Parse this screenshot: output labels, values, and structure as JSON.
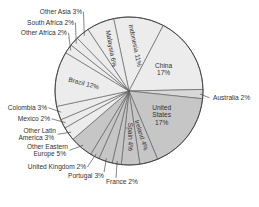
{
  "chart_data": {
    "type": "pie",
    "title": "",
    "start_angle_deg": -12,
    "direction": "clockwise",
    "center": [
      129,
      91
    ],
    "radius": 74,
    "colors": {
      "light": "#ececec",
      "medium": "#c6c6c6",
      "australia": "#d8d8d8",
      "edge": "#555555",
      "rim": "#444444"
    },
    "slices": [
      {
        "label": "Indonesia",
        "value": 11,
        "shade": "light",
        "text": "Indonesia 11%",
        "inside": true,
        "rotate": 78
      },
      {
        "label": "China",
        "value": 17,
        "shade": "light",
        "text": "China\n17%",
        "inside": true,
        "rotate": 0
      },
      {
        "label": "Australia",
        "value": 2,
        "shade": "australia",
        "text": "Australia 2%",
        "inside": false
      },
      {
        "label": "United States",
        "value": 17,
        "shade": "medium",
        "text": "United\nStates\n17%",
        "inside": true,
        "rotate": 0
      },
      {
        "label": "Ireland",
        "value": 4,
        "shade": "medium",
        "text": "Ireland 4%",
        "inside": true,
        "rotate": 72
      },
      {
        "label": "Spain",
        "value": 4,
        "shade": "medium",
        "text": "Spain 4%",
        "inside": true,
        "rotate": 90
      },
      {
        "label": "France",
        "value": 2,
        "shade": "medium",
        "text": "France 2%",
        "inside": false
      },
      {
        "label": "Portugal",
        "value": 3,
        "shade": "medium",
        "text": "Portugal 3%",
        "inside": false
      },
      {
        "label": "United Kingdom",
        "value": 2,
        "shade": "medium",
        "text": "United Kingdom 2%",
        "inside": false
      },
      {
        "label": "Other Eastern Europe",
        "value": 5,
        "shade": "medium",
        "text": "Other Eastern\nEurope 5%",
        "inside": false
      },
      {
        "label": "Other Latin America",
        "value": 3,
        "shade": "light",
        "text": "Other Latin\nAmerica 3%",
        "inside": false
      },
      {
        "label": "Mexico",
        "value": 2,
        "shade": "light",
        "text": "Mexico 2%",
        "inside": false
      },
      {
        "label": "Colombia",
        "value": 3,
        "shade": "light",
        "text": "Colombia 3%",
        "inside": false
      },
      {
        "label": "Brazil",
        "value": 12,
        "shade": "light",
        "text": "Brazil 12%",
        "inside": true,
        "rotate": 15
      },
      {
        "label": "Other Africa",
        "value": 2,
        "shade": "light",
        "text": "Other Africa 2%",
        "inside": false
      },
      {
        "label": "South Africa",
        "value": 2,
        "shade": "light",
        "text": "South Africa 2%",
        "inside": false
      },
      {
        "label": "Other Asia",
        "value": 3,
        "shade": "light",
        "text": "Other Asia 3%",
        "inside": false
      },
      {
        "label": "Malaysia",
        "value": 6,
        "shade": "light",
        "text": "Malaysia 6%",
        "inside": true,
        "rotate": 80
      }
    ],
    "external_labels": {
      "Australia": {
        "x": 211,
        "y": 100,
        "anchor": "start",
        "lines": [
          "Australia 2%"
        ]
      },
      "France": {
        "x": 104,
        "y": 184,
        "anchor": "start",
        "lines": [
          "France 2%"
        ]
      },
      "Portugal": {
        "x": 66,
        "y": 178,
        "anchor": "start",
        "lines": [
          "Portugal 3%"
        ]
      },
      "United Kingdom": {
        "x": 86,
        "y": 169,
        "anchor": "end",
        "lines": [
          "United Kingdom 2%"
        ]
      },
      "Other Eastern Europe": {
        "x": 68,
        "y": 149,
        "anchor": "end",
        "lines": [
          "Other Eastern",
          "Europe 5%"
        ]
      },
      "Other Latin America": {
        "x": 56,
        "y": 133,
        "anchor": "end",
        "lines": [
          "Other Latin",
          "America 3%"
        ]
      },
      "Mexico": {
        "x": 50,
        "y": 121,
        "anchor": "end",
        "lines": [
          "Mexico 2%"
        ]
      },
      "Colombia": {
        "x": 47,
        "y": 110,
        "anchor": "end",
        "lines": [
          "Colombia 3%"
        ]
      },
      "Other Africa": {
        "x": 67,
        "y": 35,
        "anchor": "end",
        "lines": [
          "Other Africa 2%"
        ]
      },
      "South Africa": {
        "x": 74,
        "y": 25,
        "anchor": "end",
        "lines": [
          "South Africa 2%"
        ]
      },
      "Other Asia": {
        "x": 82,
        "y": 14,
        "anchor": "end",
        "lines": [
          "Other Asia 3%"
        ]
      }
    }
  }
}
